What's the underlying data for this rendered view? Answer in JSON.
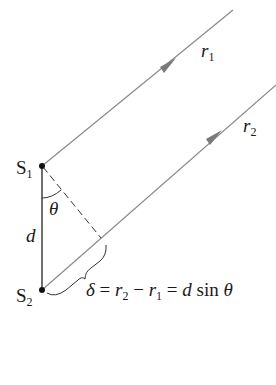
{
  "diagram": {
    "colors": {
      "ray_line": "#8a8a8a",
      "arrow": "#7a7a7a",
      "source_line": "#222222",
      "text": "#1a1a1a",
      "background": "#ffffff"
    },
    "labels": {
      "s1": {
        "main": "S",
        "sub": "1"
      },
      "s2": {
        "main": "S",
        "sub": "2"
      },
      "d": "d",
      "theta": "θ",
      "r1": {
        "main": "r",
        "sub": "1"
      },
      "r2": {
        "main": "r",
        "sub": "2"
      },
      "equation": {
        "delta": "δ",
        "eq1": " = ",
        "r2": "r",
        "r2_sub": "2",
        "minus": " − ",
        "r1": "r",
        "r1_sub": "1",
        "eq2": " = ",
        "d": "d",
        "sin": " sin ",
        "theta": "θ"
      }
    },
    "elements": {
      "sources": [
        "S1",
        "S2"
      ],
      "rays": [
        "r1",
        "r2"
      ],
      "separation": "d",
      "angle": "θ",
      "path_difference": "δ = r2 − r1 = d sin θ"
    }
  }
}
